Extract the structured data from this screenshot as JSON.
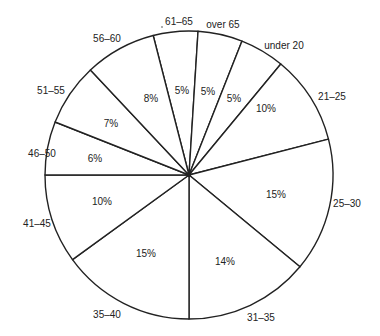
{
  "chart_data": {
    "type": "pie",
    "title": "",
    "start_angle_deg_clockwise_from_top": -14.4,
    "direction": "clockwise",
    "colors": {
      "fill": "#ffffff",
      "stroke": "#222222",
      "text": "#222222"
    },
    "categories": [
      "61–65",
      "over 65",
      "under 20",
      "21–25",
      "25–30",
      "31–35",
      "35–40",
      "41–45",
      "46–50",
      "51–55",
      "56–60"
    ],
    "values": [
      5,
      5,
      5,
      10,
      15,
      14,
      15,
      10,
      6,
      7,
      8
    ],
    "value_labels": [
      "5%",
      "5%",
      "5%",
      "10%",
      "15%",
      "14%",
      "15%",
      "10%",
      "6%",
      "7%",
      "8%"
    ],
    "legend": "none (labels placed outside slices)"
  },
  "slices": [
    {
      "category": "61–65",
      "pct": "5%",
      "cat_pos": [
        179,
        21
      ],
      "pct_pos": [
        182,
        90
      ]
    },
    {
      "category": "over 65",
      "pct": "5%",
      "cat_pos": [
        223,
        24
      ],
      "pct_pos": [
        208,
        91
      ]
    },
    {
      "category": "under 20",
      "pct": "5%",
      "cat_pos": [
        284,
        45
      ],
      "pct_pos": [
        234,
        98
      ]
    },
    {
      "category": "21–25",
      "pct": "10%",
      "cat_pos": [
        332,
        96
      ],
      "pct_pos": [
        266,
        108
      ]
    },
    {
      "category": "25–30",
      "pct": "15%",
      "cat_pos": [
        347,
        203
      ],
      "pct_pos": [
        276,
        194
      ]
    },
    {
      "category": "31–35",
      "pct": "14%",
      "cat_pos": [
        261,
        317
      ],
      "pct_pos": [
        225,
        261
      ]
    },
    {
      "category": "35–40",
      "pct": "15%",
      "cat_pos": [
        107,
        314
      ],
      "pct_pos": [
        146,
        253
      ]
    },
    {
      "category": "41–45",
      "pct": "10%",
      "cat_pos": [
        37,
        223
      ],
      "pct_pos": [
        102,
        201
      ]
    },
    {
      "category": "46–50",
      "pct": "6%",
      "cat_pos": [
        42,
        153
      ],
      "pct_pos": [
        95,
        158
      ]
    },
    {
      "category": "51–55",
      "pct": "7%",
      "cat_pos": [
        51,
        90
      ],
      "pct_pos": [
        111,
        123
      ]
    },
    {
      "category": "56–60",
      "pct": "8%",
      "cat_pos": [
        107,
        38
      ],
      "pct_pos": [
        151,
        98
      ]
    }
  ]
}
